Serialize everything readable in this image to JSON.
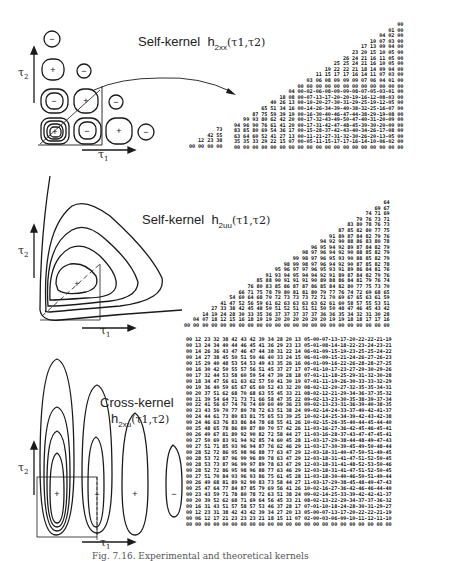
{
  "figure": {
    "caption": "Fig. 7.16. Experimental and theoretical kernels",
    "panels": [
      {
        "id": "self-kernel-xx",
        "title": "Self-kernel",
        "symbol": "h",
        "subscript": "2xx",
        "args": "(τ1,τ2)",
        "axis_x": "τ1",
        "axis_y": "τ2",
        "contour_signs": [
          "−",
          "+",
          "−",
          "−",
          "+",
          "−",
          "+",
          "−",
          "+",
          "−"
        ],
        "table_rows": [
          "                                                        00",
          "                                                     01 00",
          "                                                  04 02 00",
          "                                               10 07 03 00",
          "                                            17 13 09 04 00",
          "                                         23 20 15 10 05 00",
          "                                      26 24 21 16 11 05 00",
          "                                   25 25 24 21 16 10 05 00",
          "                                19 22 22 21 18 14 09 04 00",
          "                             11 15 17 17 16 14 11 07 03 00",
          "                          03 06 08 09 09 09 07 06 04 01 00",
          "                       00 00 00 00 00 00 00 00 00 00 00 00",
          "                    04 00-02-06-08-09-09-08-07-05-03-01 00",
          "                 18 08 00-07-13-17-20-20-19-16-12-08-03 00",
          "              40 26 13 00-10-20-27-30-31-29-25-19-12-05 00",
          "           65 51 34 16 00-14-26-34-39-40-38-32-25-16-07 00",
          "        87 75 59 39 19 00-16-30-40-46-47-44-38-29-19-08 00",
          "     99 93 80 62 42 20 00-17-32-43-49-50-47-40-31-20-09 00",
          "  94 96 90 76 61 41 20 00-17-31-42-47-48-45-39-30-20-09 00",
          "  83 85 80 69 54 36 17 00-15-28-37-42-43-40-34-26-17-08 00",
          "  63 64 60 52 41 27 13 00-11-21-27-31-32-30-26-20-13-05 00",
          "  35 35 33 29 22 15 07 00-05-11-15-17-17-16-14-10-06-02 00",
          "  00 00 00 00 00 00 00 00 00 00 00 00 00 00 00 00 00 00 00"
        ],
        "table_left_rows": [
          "          73",
          "       42 55",
          "    12 23 38",
          " 00 00 00 00"
        ]
      },
      {
        "id": "self-kernel-uu",
        "title": "Self-kernel",
        "symbol": "h",
        "subscript": "2uu",
        "args": "(τ1,τ2)",
        "axis_x": "τ1",
        "axis_y": "τ2",
        "contour_signs": [
          "+"
        ],
        "table_rows": [
          "                                                                  64",
          "                                                               69 67",
          "                                                            74 71 69",
          "                                                         79 76 73 71",
          "                                                      83 80 78 76 73",
          "                                                   87 85 82 80 77 75",
          "                                                91 89 87 84 82 79 76",
          "                                             94 92 90 88 86 83 80 78",
          "                                          96 95 94 92 89 87 84 82 79",
          "                                       98 97 96 94 92 90 88 85 82 79",
          "                                    99 98 97 96 95 93 90 88 85 82 79",
          "                                 98 99 98 97 96 94 92 90 87 85 82 78",
          "                              95 96 97 97 96 95 93 91 89 86 84 81 76",
          "                           91 93 94 95 94 94 92 91 89 87 84 82 79 76",
          "                        85 88 90 91 91 91 90 89 88 86 84 81 79 76 74",
          "                     76 80 83 85 86 87 87 86 85 84 82 80 77 75 73 70",
          "                  66 71 75 78 79 80 81 81 80 79 77 76 74 72 69 68 65",
          "               54 60 64 68 70 72 73 73 73 72 71 70 69 67 65 63 61 59",
          "            41 47 52 56 59 61 62 63 63 63 63 62 61 60 58 57 55 53 51",
          "         27 33 38 42 45 48 50 51 52 51 51 51 50 50 48 47 46 45 43 42",
          "      14 19 24 28 30 33 35 36 37 37 37 37 37 36 36 35 34 32 31 30 28",
          "   04 07 18 12 15 16 18 19 19 20 20 20 20 20 20 19 19 18 18 17 17 16",
          "00 00 00 00 00 00 00 00 00 00 00 00 00 00 00 00 00 00 00 00 00 00 00"
        ]
      },
      {
        "id": "cross-kernel-xu",
        "title": "Cross-kernel",
        "symbol": "h",
        "subscript": "2xu",
        "args": "(τ1,τ2)",
        "axis_x": "τ1",
        "axis_y": "τ2",
        "contour_signs": [
          "+",
          "−",
          "+",
          "−"
        ],
        "table_rows": [
          "00 12 23 32 38 42 43 42 39 34 28 20 13 05-00-07-13-17-20-22-22-21-19",
          "00 13 24 34 40 44 46 45 41 36 29 23 13 05-01-08-14-18-22-23-24-23-21",
          "00 14 26 36 43 47 46 47 44 38 31 22 14 06-01-09-15-19-23-25-25-24-22",
          "00 14 27 38 45 50 51 50 46 40 33 24 15 06-01-09-15-21-24-26-27-26-23",
          "00 15 29 40 48 53 54 53 49 43 35 26 16 06-01-09-16-22-26-28-28-27-25",
          "00 16 30 42 50 55 57 56 51 45 37 27 17 07-01-10-17-23-27-29-30-29-26",
          "00 17 32 44 53 58 60 59 54 47 39 28 18 07-01-11-18-25-29-31-32-30-28",
          "00 18 34 47 56 61 63 62 57 50 41 30 19 07-01-11-19-26-30-33-33-32-29",
          "00 19 36 49 59 65 67 65 60 52 43 32 20 08-02-12-20-27-32-35-35-34-31",
          "00 20 37 51 62 68 70 68 63 55 45 33 21 08-02-12-21-29-34-36-37-35-32",
          "00 21 39 54 64 71 73 71 66 58 47 35 22 09-02-13-23-30-35-38-39-37-34",
          "00 22 41 56 67 74 76 74 69 60 49 36 23 09-02-13-23-31-36-39-40-38-35",
          "00 23 43 59 70 77 80 78 72 63 51 38 24 09-02-14-24-33-37-40-42-41-37",
          "00 24 44 61 73 80 83 81 75 65 53 39 25 10-02-14-25-34-39-42-43-42-38",
          "00 24 46 63 76 83 86 84 78 68 55 41 26 10-02-15-26-35-40-44-45-44-40",
          "00 25 48 65 78 86 89 87 80 70 57 42 26 11-03-16-27-36-42-45-46-45-41",
          "00 26 49 67 81 89 92 90 82 72 58 44 27 11-03-16-28-37-43-47-47-45-41",
          "00 27 50 69 83 91 94 92 85 74 60 45 28 11-03-17-29-38-44-48-49-47-43",
          "00 27 51 71 85 93 96 94 87 76 62 46 29 11-03-17-30-39-45-49-50-48-44",
          "00 28 52 72 86 95 98 96 88 77 63 47 29 12-03-18-31-40-47-50-51-49-45",
          "00 28 53 72 87 96 99 96 89 78 63 47 29 12-03-18-31-41-47-51-52-50-45",
          "00 28 53 73 87 96 99 97 89 78 63 47 29 12-03-18-31-41-48-52-53-50-46",
          "00 28 52 72 86 95 98 96 88 77 63 46 29 12-03-18-31-41-47-51-52-50-45",
          "00 27 51 70 84 93 96 93 86 75 61 45 28 11-03-18-30-40-46-50-51-49-44",
          "00 26 49 68 81 89 92 90 83 73 58 44 27 11-03-17-29-38-45-48-49-47-43",
          "00 25 47 64 77 84 87 85 79 69 56 41 26 10-02-16-27-36-42-46-46-44-40",
          "00 23 43 59 71 78 80 78 72 63 51 38 24 09-02-14-25-33-39-42-42-41-37",
          "00 20 39 52 62 68 71 69 64 56 45 33 21 08-02-13-22-29-34-37-37-36-32",
          "00 16 31 43 51 57 58 57 53 46 37 28 17 07-01-10-18-24-28-30-31-29-27",
          "00 12 23 31 38 42 43 42 39 34 27 20 13 05-00-07-13-17-20-22-22-21-19",
          "00 06 12 17 21 23 23 23 21 18 15 11 07 02-00-03-06-09-10-11-12-11-10",
          "00 00 00 00 00 00 00 00 00 00 00 00 00 00 00 00 00 00 00 00 00 00 00"
        ]
      }
    ]
  }
}
